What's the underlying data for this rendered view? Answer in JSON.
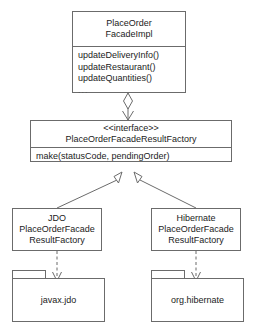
{
  "diagram": {
    "kind": "uml-class-diagram",
    "background_color": "#ffffff",
    "line_color": "#6b6b6b",
    "text_color": "#1b1b1b"
  },
  "facade_class": {
    "name_line1": "PlaceOrder",
    "name_line2": "FacadeImpl",
    "operations": [
      "updateDeliveryInfo()",
      "updateRestaurant()",
      "updateQuantities()"
    ],
    "ellipsis": "..."
  },
  "factory_interface": {
    "stereotype": "<<interface>>",
    "name": "PlaceOrderFacadeResultFactory",
    "operations": [
      "make(statusCode, pendingOrder)"
    ]
  },
  "jdo_class": {
    "name_line1": "JDO",
    "name_line2": "PlaceOrderFacade",
    "name_line3": "ResultFactory"
  },
  "hibernate_class": {
    "name_line1": "Hibernate",
    "name_line2": "PlaceOrderFacade",
    "name_line3": "ResultFactory"
  },
  "jdo_package": {
    "name": "javax.jdo"
  },
  "hibernate_package": {
    "name": "org.hibernate"
  },
  "relationships": [
    {
      "id": "facade-uses-factory",
      "type": "aggregation-with-arrow",
      "from": "PlaceOrderFacadeImpl",
      "to": "PlaceOrderFacadeResultFactory",
      "style": "solid"
    },
    {
      "id": "jdo-realizes-factory",
      "type": "generalization",
      "from": "JDOPlaceOrderFacadeResultFactory",
      "to": "PlaceOrderFacadeResultFactory",
      "style": "solid"
    },
    {
      "id": "hibernate-realizes-factory",
      "type": "generalization",
      "from": "HibernatePlaceOrderFacadeResultFactory",
      "to": "PlaceOrderFacadeResultFactory",
      "style": "solid"
    },
    {
      "id": "jdo-depends-javaxjdo",
      "type": "dependency",
      "from": "JDOPlaceOrderFacadeResultFactory",
      "to": "javax.jdo",
      "style": "dashed"
    },
    {
      "id": "hibernate-depends-orghibernate",
      "type": "dependency",
      "from": "HibernatePlaceOrderFacadeResultFactory",
      "to": "org.hibernate",
      "style": "dashed"
    }
  ]
}
